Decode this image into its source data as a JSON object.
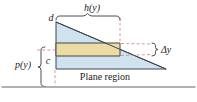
{
  "figure": {
    "labels": {
      "height_fn": "h(y)",
      "upper_bound": "d",
      "lower_bound": "c",
      "depth_fn": "p(y)",
      "strip_thickness": "Δy",
      "region_caption": "Plane region"
    },
    "colors": {
      "region_fill": "#cfe2ee",
      "strip_fill": "#ecdba2",
      "outline": "#3c4750",
      "dashed": "#d3817e",
      "brace": "#3a3a3a",
      "surface_line": "#92999d",
      "text": "#1c1c1c"
    }
  }
}
